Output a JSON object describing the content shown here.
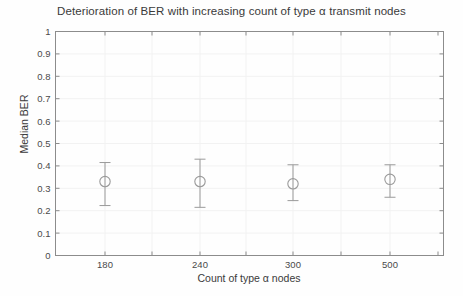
{
  "chart_data": {
    "type": "scatter",
    "title": "Deterioration of BER with increasing count of type α transmit nodes",
    "xlabel": "Count of type α nodes",
    "ylabel": "Median BER",
    "categories": [
      "180",
      "240",
      "300",
      "500"
    ],
    "x": [
      180,
      240,
      300,
      500
    ],
    "values": [
      0.33,
      0.33,
      0.32,
      0.34
    ],
    "error_low": [
      0.223,
      0.215,
      0.245,
      0.26
    ],
    "error_high": [
      0.415,
      0.43,
      0.405,
      0.405
    ],
    "series": [
      {
        "name": "Median BER",
        "values": [
          0.33,
          0.33,
          0.32,
          0.34
        ],
        "error_low": [
          0.223,
          0.215,
          0.245,
          0.26
        ],
        "error_high": [
          0.415,
          0.43,
          0.405,
          0.405
        ]
      }
    ],
    "ylim": [
      0,
      1
    ],
    "ytick_labels": [
      "0",
      "0.1",
      "0.2",
      "0.3",
      "0.4",
      "0.5",
      "0.6",
      "0.7",
      "0.8",
      "0.9",
      "1"
    ],
    "ytick_values": [
      0,
      0.1,
      0.2,
      0.3,
      0.4,
      0.5,
      0.6,
      0.7,
      0.8,
      0.9,
      1
    ],
    "xtick_labels": [
      "180",
      "240",
      "300",
      "500"
    ],
    "grid": true,
    "legend": "none",
    "marker": "open-circle",
    "line_color": "#9a9a9a",
    "axis_color": "#8c8c8c",
    "grid_color": "#f2f2f2",
    "background_color": "#ffffff"
  },
  "axis": {
    "y_ticks": [
      "1",
      "0.9",
      "0.8",
      "0.7",
      "0.6",
      "0.5",
      "0.4",
      "0.3",
      "0.2",
      "0.1",
      "0"
    ],
    "x_ticks": [
      "180",
      "240",
      "300",
      "500"
    ]
  }
}
